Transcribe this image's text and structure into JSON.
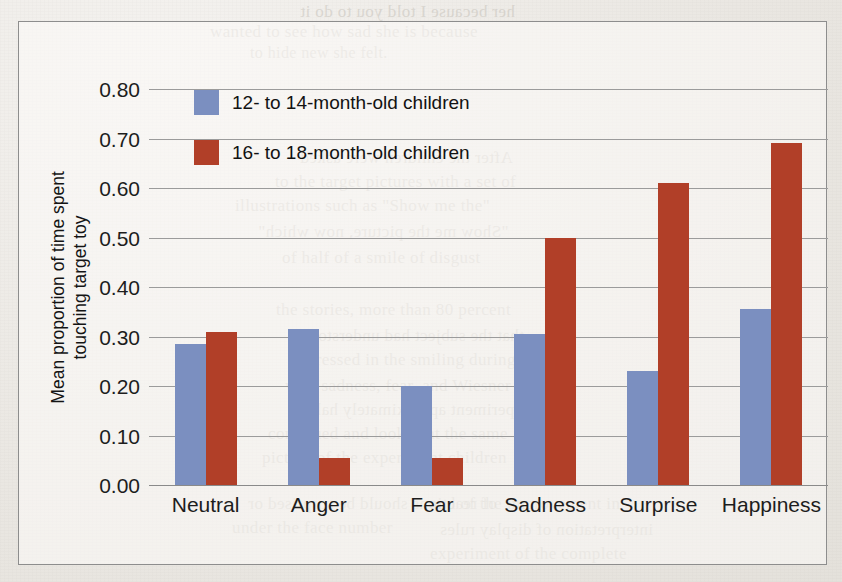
{
  "figure": {
    "frame_border_color": "#8d8d8d",
    "background_color": "#efedea"
  },
  "legend": {
    "position": "upper-left-inside",
    "items": [
      {
        "label": "12- to 14-month-old children",
        "color": "#7b8fc0",
        "swatch_name": "legend-swatch-blue"
      },
      {
        "label": "16- to 18-month-old children",
        "color": "#b13f28",
        "swatch_name": "legend-swatch-red"
      }
    ]
  },
  "axes": {
    "ylabel_line1": "Mean proportion of time spent",
    "ylabel_line2": "touching target toy",
    "xlabel": "",
    "yticks": [
      "0.80",
      "0.70",
      "0.60",
      "0.50",
      "0.40",
      "0.30",
      "0.20",
      "0.10",
      "0.00"
    ],
    "ytick_values": [
      0.8,
      0.7,
      0.6,
      0.5,
      0.4,
      0.3,
      0.2,
      0.1,
      0.0
    ]
  },
  "chart_data": {
    "type": "bar",
    "title": "",
    "xlabel": "",
    "ylabel": "Mean proportion of time spent touching target toy",
    "ylim": [
      0.0,
      0.8
    ],
    "ytick_step": 0.1,
    "grid": true,
    "legend_position": "upper left",
    "categories": [
      "Neutral",
      "Anger",
      "Fear",
      "Sadness",
      "Surprise",
      "Happiness"
    ],
    "series": [
      {
        "name": "12- to 14-month-old children",
        "color": "#7b8fc0",
        "values": [
          0.285,
          0.315,
          0.2,
          0.305,
          0.23,
          0.355
        ]
      },
      {
        "name": "16- to 18-month-old children",
        "color": "#b13f28",
        "values": [
          0.31,
          0.055,
          0.055,
          0.5,
          0.61,
          0.69
        ]
      }
    ]
  },
  "bleed_through": {
    "lines": [
      {
        "text": "her because I told you to do it",
        "x": 300,
        "y": 2,
        "size": 17
      },
      {
        "text": "wanted to see how sad she is because",
        "x": 210,
        "y": 22,
        "size": 17
      },
      {
        "text": "to hide new she felt.",
        "x": 250,
        "y": 44,
        "size": 16
      },
      {
        "text": "After the children were asked",
        "x": 300,
        "y": 148,
        "size": 17
      },
      {
        "text": "to the target pictures with a set of",
        "x": 275,
        "y": 172,
        "size": 17
      },
      {
        "text": "illustrations such as \"Show me the\"",
        "x": 235,
        "y": 196,
        "size": 17
      },
      {
        "text": "\"Show me the picture, now which\"",
        "x": 258,
        "y": 222,
        "size": 17
      },
      {
        "text": "of half of a smile of disgust",
        "x": 282,
        "y": 248,
        "size": 17
      },
      {
        "text": "the stories, more than 80 percent",
        "x": 276,
        "y": 300,
        "size": 17
      },
      {
        "text": "that the subject had understood",
        "x": 300,
        "y": 326,
        "size": 17
      },
      {
        "text": "expressed in the smiling during",
        "x": 290,
        "y": 350,
        "size": 17
      },
      {
        "text": "with sadness, fear, and Wiesner",
        "x": 285,
        "y": 376,
        "size": 17
      },
      {
        "text": "experiment approximately half",
        "x": 310,
        "y": 400,
        "size": 17
      },
      {
        "text": "continued and looked at the same",
        "x": 268,
        "y": 424,
        "size": 17
      },
      {
        "text": "picture of the experiment children",
        "x": 262,
        "y": 448,
        "size": 17
      },
      {
        "text": "of reactions should be surprised or",
        "x": 248,
        "y": 494,
        "size": 17
      },
      {
        "text": "under the face number",
        "x": 232,
        "y": 518,
        "size": 17
      },
      {
        "text": "and of the improvement in",
        "x": 430,
        "y": 494,
        "size": 17
      },
      {
        "text": "interpretation of display rules",
        "x": 440,
        "y": 520,
        "size": 17
      },
      {
        "text": "experiment of the complete",
        "x": 430,
        "y": 544,
        "size": 17
      }
    ]
  }
}
